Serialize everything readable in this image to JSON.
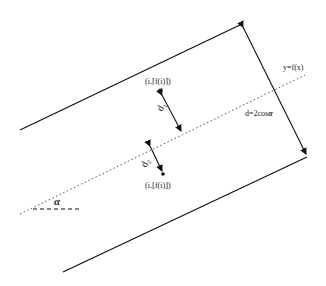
{
  "diagram": {
    "labels": {
      "curve": "y=f(x)",
      "distance": "d=2cos",
      "alpha": "α",
      "upper_point": "(i,⌈f(i)⌉)",
      "lower_point": "(i,⌊f(i)⌋)",
      "d1": "d₁",
      "d2": "d₂"
    },
    "colors": {
      "line": "#111111",
      "dotted": "#555555",
      "background": "#ffffff"
    }
  }
}
